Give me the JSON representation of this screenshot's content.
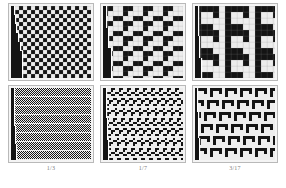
{
  "figure": {
    "background_color": "#ffffff",
    "panel_border_color": "#b9b9b9",
    "panel_background_color": "#f4f4f4",
    "grid_line_color": "#8c8c8c",
    "cell_on_color": "#141414",
    "cell_off_color": "#ededed",
    "rows": 2,
    "columns": 3
  },
  "panels": [
    {
      "id": "panel-top-left",
      "row": "top",
      "column": 1,
      "cell_px": 4,
      "cols": 20,
      "rows": 18,
      "density": "dense-checker",
      "motif": "single-cell checkerboard with staircase seed",
      "steps": [
        {
          "top": 0,
          "width": 3,
          "height": 9
        },
        {
          "top": 9,
          "width": 4,
          "height": 9
        },
        {
          "top": 18,
          "width": 5,
          "height": 9
        },
        {
          "top": 27,
          "width": 7,
          "height": 9
        },
        {
          "top": 36,
          "width": 9,
          "height": 9
        },
        {
          "top": 45,
          "width": 11,
          "height": 27
        }
      ]
    },
    {
      "id": "panel-top-middle",
      "row": "top",
      "column": 2,
      "cell_px": 5,
      "cols": 16,
      "rows": 14,
      "density": "medium-blocks",
      "motif": "L-shaped tromino tiling with staircase seed",
      "steps": [
        {
          "top": 0,
          "width": 3,
          "height": 22
        },
        {
          "top": 22,
          "width": 5,
          "height": 20
        },
        {
          "top": 42,
          "width": 8,
          "height": 32
        }
      ]
    },
    {
      "id": "panel-top-right",
      "row": "top",
      "column": 3,
      "cell_px": 6,
      "cols": 14,
      "rows": 12,
      "density": "coarse-blocks",
      "motif": "large hook glyph tiling with staircase seed",
      "steps": [
        {
          "top": 0,
          "width": 3,
          "height": 30
        },
        {
          "top": 30,
          "width": 4,
          "height": 22
        },
        {
          "top": 52,
          "width": 6,
          "height": 22
        }
      ]
    },
    {
      "id": "panel-bottom-left",
      "row": "bottom",
      "column": 1,
      "cell_px": 1,
      "cols": 80,
      "rows": 72,
      "density": "very-fine-stripes",
      "motif": "fine horizontal banded texture, staircase seed",
      "steps": [
        {
          "top": 0,
          "width": 3,
          "height": 38
        },
        {
          "top": 38,
          "width": 4,
          "height": 18
        },
        {
          "top": 56,
          "width": 5,
          "height": 18
        }
      ]
    },
    {
      "id": "panel-bottom-middle",
      "row": "bottom",
      "column": 2,
      "cell_px": 2,
      "cols": 40,
      "rows": 36,
      "density": "fine-texture",
      "motif": "fine repeated tromino texture in horizontal bands",
      "steps": [
        {
          "top": 0,
          "width": 3,
          "height": 30
        },
        {
          "top": 30,
          "width": 4,
          "height": 22
        },
        {
          "top": 52,
          "width": 5,
          "height": 22
        }
      ]
    },
    {
      "id": "panel-bottom-right",
      "row": "bottom",
      "column": 3,
      "cell_px": 3,
      "cols": 27,
      "rows": 24,
      "density": "medium-texture",
      "motif": "repeated hook glyph texture in horizontal bands",
      "steps": [
        {
          "top": 0,
          "width": 2,
          "height": 24
        },
        {
          "top": 24,
          "width": 3,
          "height": 26
        },
        {
          "top": 50,
          "width": 4,
          "height": 24
        }
      ]
    }
  ],
  "captions": [
    {
      "id": "caption-left",
      "text": "1/3"
    },
    {
      "id": "caption-middle",
      "text": "1/7"
    },
    {
      "id": "caption-right",
      "text": "3/17"
    }
  ]
}
